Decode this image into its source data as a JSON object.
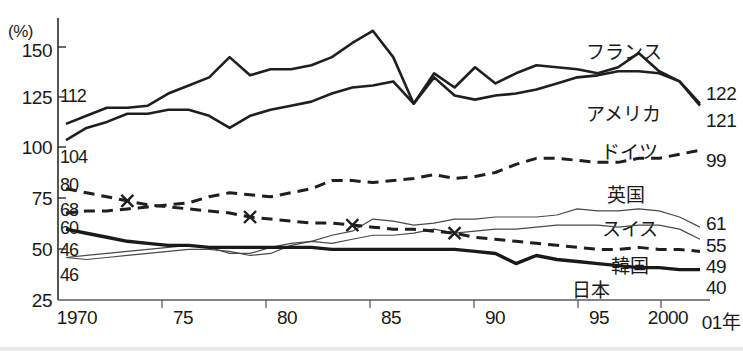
{
  "axis": {
    "unit_label": "(%)",
    "y_ticks": [
      "150",
      "125",
      "100",
      "75",
      "50",
      "25"
    ],
    "x_ticks": [
      "1970",
      "75",
      "80",
      "85",
      "90",
      "95",
      "2000",
      "01年"
    ]
  },
  "start_labels": [
    "112",
    "104",
    "80",
    "68",
    "60",
    "46",
    "46"
  ],
  "end_labels": [
    "122",
    "121",
    "99",
    "61",
    "55",
    "49",
    "40"
  ],
  "series_labels": {
    "france": "フランス",
    "america": "アメリカ",
    "germany": "ドイツ",
    "uk": "英国",
    "switzerland": "スイス",
    "korea": "韓国",
    "japan": "日本"
  },
  "chart_data": {
    "type": "line",
    "title": "",
    "xlabel": "",
    "ylabel": "(%)",
    "ylim": [
      25,
      150
    ],
    "xlim": [
      1970,
      2001
    ],
    "grid": false,
    "legend": "inline-annotations",
    "x": [
      1970,
      1971,
      1972,
      1973,
      1974,
      1975,
      1976,
      1977,
      1978,
      1979,
      1980,
      1981,
      1982,
      1983,
      1984,
      1985,
      1986,
      1987,
      1988,
      1989,
      1990,
      1991,
      1992,
      1993,
      1994,
      1995,
      1996,
      1997,
      1998,
      1999,
      2000,
      2001
    ],
    "series": [
      {
        "name": "フランス",
        "name_en": "France",
        "style": "thick-solid",
        "start_value": 112,
        "end_value": 122,
        "values": [
          112,
          116,
          120,
          120,
          121,
          127,
          131,
          135,
          145,
          136,
          139,
          139,
          141,
          145,
          152,
          158,
          145,
          122,
          137,
          130,
          140,
          132,
          137,
          141,
          140,
          139,
          137,
          140,
          147,
          138,
          133,
          122
        ]
      },
      {
        "name": "アメリカ",
        "name_en": "America",
        "style": "thick-solid",
        "start_value": 104,
        "end_value": 121,
        "values": [
          104,
          110,
          113,
          117,
          117,
          119,
          119,
          116,
          110,
          116,
          119,
          121,
          123,
          127,
          130,
          131,
          133,
          122,
          135,
          126,
          124,
          126,
          127,
          129,
          132,
          135,
          136,
          138,
          138,
          137,
          133,
          121
        ]
      },
      {
        "name": "ドイツ",
        "name_en": "Germany",
        "style": "dashed",
        "start_value": 68,
        "end_value": 99,
        "values": [
          68,
          69,
          69,
          70,
          71,
          72,
          73,
          76,
          78,
          77,
          76,
          78,
          80,
          84,
          84,
          83,
          84,
          85,
          87,
          85,
          86,
          88,
          92,
          95,
          95,
          94,
          93,
          93,
          95,
          95,
          97,
          99
        ]
      },
      {
        "name": "英国",
        "name_en": "United Kingdom",
        "style": "thin-solid",
        "start_value": 46,
        "end_value": 61,
        "values": [
          46,
          45,
          46,
          47,
          48,
          49,
          50,
          50,
          49,
          47,
          48,
          52,
          54,
          57,
          59,
          65,
          64,
          62,
          63,
          65,
          65,
          66,
          66,
          66,
          67,
          70,
          69,
          69,
          70,
          69,
          66,
          61
        ]
      },
      {
        "name": "スイス",
        "name_en": "Switzerland",
        "style": "thin-solid",
        "start_value": 46,
        "end_value": 55,
        "values": [
          46,
          47,
          48,
          49,
          50,
          51,
          52,
          51,
          48,
          48,
          51,
          53,
          54,
          53,
          55,
          57,
          57,
          58,
          60,
          58,
          59,
          60,
          60,
          61,
          62,
          62,
          62,
          61,
          62,
          62,
          60,
          55
        ]
      },
      {
        "name": "韓国",
        "name_en": "Korea",
        "style": "dashed-x",
        "start_value": 80,
        "end_value": 49,
        "values": [
          80,
          78,
          76,
          74,
          72,
          71,
          70,
          69,
          68,
          66,
          65,
          64,
          63,
          63,
          62,
          61,
          60,
          60,
          59,
          58,
          56,
          55,
          54,
          53,
          52,
          51,
          50,
          50,
          51,
          50,
          50,
          49
        ],
        "markers_at": [
          1973,
          1979,
          1984,
          1989
        ]
      },
      {
        "name": "日本",
        "name_en": "Japan",
        "style": "extra-thick-solid",
        "start_value": 60,
        "end_value": 40,
        "values": [
          60,
          58,
          56,
          54,
          53,
          52,
          52,
          51,
          51,
          51,
          51,
          51,
          51,
          50,
          50,
          50,
          50,
          50,
          50,
          50,
          49,
          48,
          43,
          47,
          45,
          44,
          43,
          42,
          41,
          41,
          40,
          40
        ]
      }
    ]
  }
}
